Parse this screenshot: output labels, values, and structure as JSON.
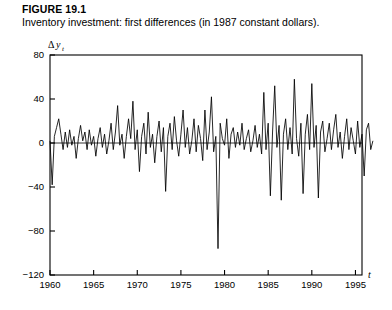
{
  "figure": {
    "number": "FIGURE 19.1",
    "caption": "Inventory investment: first differences (in 1987 constant dollars)."
  },
  "chart_data": {
    "type": "line",
    "title": "Inventory investment: first differences (in 1987 constant dollars).",
    "subtitle": "FIGURE 19.1",
    "xlabel": "t",
    "ylabel": "Δy",
    "ylabel_symbol": "Δ",
    "ylabel_var": "y",
    "ylabel_subscript": "t",
    "xlim": [
      1960,
      1995.75
    ],
    "ylim": [
      -120,
      80
    ],
    "xticks": [
      1960,
      1965,
      1970,
      1975,
      1980,
      1985,
      1990,
      1995
    ],
    "xtick_labels": [
      "1960",
      "1965",
      "1970",
      "1975",
      "1980",
      "1985",
      "1990",
      "1995"
    ],
    "yticks": [
      80,
      40,
      0,
      -40,
      -80,
      -120
    ],
    "ytick_labels": [
      "80",
      "40",
      "0",
      "−40",
      "−80",
      "−120"
    ],
    "grid": false,
    "legend": false,
    "zero_line": true,
    "line_color": "#000000",
    "frame_color": "#000000",
    "series": [
      {
        "name": "Inventory investment first differences",
        "x_start": 1960.0,
        "x_step": 0.25,
        "values": [
          2,
          -38,
          6,
          14,
          22,
          8,
          -6,
          10,
          -4,
          12,
          -2,
          6,
          -14,
          4,
          16,
          2,
          10,
          -6,
          12,
          -2,
          6,
          -12,
          4,
          14,
          -4,
          8,
          -10,
          2,
          18,
          -6,
          10,
          34,
          -2,
          8,
          -14,
          6,
          22,
          4,
          38,
          -6,
          12,
          -26,
          6,
          18,
          -10,
          28,
          -4,
          8,
          -18,
          6,
          20,
          -8,
          14,
          -44,
          6,
          18,
          -6,
          24,
          2,
          -12,
          8,
          30,
          -4,
          14,
          -10,
          2,
          22,
          -8,
          16,
          4,
          -16,
          30,
          -6,
          10,
          42,
          -8,
          6,
          -96,
          18,
          4,
          -2,
          22,
          -14,
          8,
          14,
          -4,
          10,
          -2,
          18,
          -6,
          4,
          12,
          -8,
          2,
          16,
          -4,
          8,
          -10,
          46,
          -6,
          18,
          -48,
          10,
          52,
          -4,
          16,
          -52,
          8,
          22,
          -6,
          14,
          -10,
          58,
          4,
          -12,
          18,
          -46,
          8,
          26,
          -6,
          54,
          -4,
          16,
          -50,
          10,
          20,
          -8,
          4,
          18,
          -6,
          12,
          26,
          -4,
          10,
          -14,
          6,
          22,
          -6,
          14,
          2,
          -10,
          20,
          -4,
          8,
          -30,
          12,
          18,
          -6,
          2
        ]
      }
    ],
    "annotations": []
  },
  "layout": {
    "plot_left": 50,
    "plot_top": 55,
    "plot_right": 362,
    "plot_bottom": 275
  }
}
